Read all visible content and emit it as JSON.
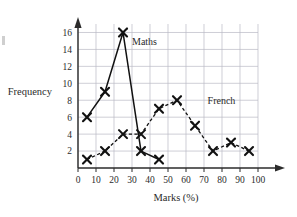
{
  "chart_data": {
    "type": "line",
    "title": "",
    "xlabel": "Marks (%)",
    "ylabel": "Frequency",
    "xlim": [
      0,
      100
    ],
    "ylim": [
      0,
      17
    ],
    "grid": true,
    "legend_position": "inline-annotations",
    "xticks": [
      0,
      10,
      20,
      30,
      40,
      50,
      60,
      70,
      80,
      90,
      100
    ],
    "yticks": [
      2,
      4,
      6,
      8,
      10,
      12,
      14,
      16
    ],
    "x": [
      5,
      15,
      25,
      35,
      45,
      55,
      65,
      75,
      85,
      95
    ],
    "series": [
      {
        "name": "Maths",
        "style": "solid",
        "marker": "x",
        "x": [
          5,
          15,
          25,
          35,
          45
        ],
        "values": [
          6,
          9,
          16,
          2,
          1
        ]
      },
      {
        "name": "French",
        "style": "dashed",
        "marker": "x",
        "x": [
          5,
          15,
          25,
          35,
          45,
          55,
          65,
          75,
          85,
          95
        ],
        "values": [
          1,
          2,
          4,
          4,
          7,
          8,
          5,
          2,
          3,
          2
        ]
      }
    ],
    "annotations": [
      {
        "text": "Maths",
        "x": 30,
        "y": 14.5
      },
      {
        "text": "French",
        "x": 72,
        "y": 7.5
      }
    ]
  },
  "axes": {
    "y_title": "Frequency",
    "x_title": "Marks (%)",
    "y_tick_labels": [
      "16",
      "14",
      "12",
      "10",
      "8",
      "6",
      "4",
      "2"
    ],
    "x_tick_labels": [
      "0",
      "10",
      "20",
      "30",
      "40",
      "50",
      "60",
      "70",
      "80",
      "90",
      "100"
    ]
  },
  "labels": {
    "maths": "Maths",
    "french": "French"
  },
  "colors": {
    "grid": "#b9b9c4",
    "axis": "#2b2b2b",
    "series": "#111111",
    "background": "#ffffff"
  }
}
